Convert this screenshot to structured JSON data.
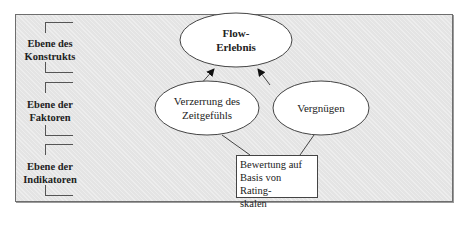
{
  "levels": [
    {
      "label_line1": "Ebene des",
      "label_line2": "Konstrukts"
    },
    {
      "label_line1": "Ebene der",
      "label_line2": "Faktoren"
    },
    {
      "label_line1": "Ebene der",
      "label_line2": "Indikatoren"
    }
  ],
  "nodes": {
    "construct": {
      "line1": "Flow-",
      "line2": "Erlebnis"
    },
    "factor_left": {
      "line1": "Verzerrung des",
      "line2": "Zeitgefühls"
    },
    "factor_right": {
      "line1": "Vergnügen"
    },
    "indicator": {
      "line1": "Bewertung auf",
      "line2": "Basis von Rating-",
      "line3": "skalen"
    }
  },
  "colors": {
    "background": "#e4e4e4",
    "node_fill": "#ffffff",
    "stroke": "#444444"
  }
}
